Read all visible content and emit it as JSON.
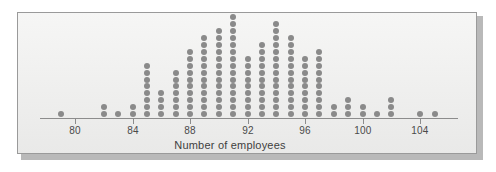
{
  "figure": {
    "panel_background": "#f2f2f1",
    "panel_border_color": "#9a9a9a",
    "dot_color": "#8a8a8a",
    "axis_color": "#8c8c8c"
  },
  "chart_data": {
    "type": "scatter",
    "plot_style": "dot-plot",
    "title": "",
    "subtitle": "",
    "xlabel": "Number of employees",
    "ylabel": "",
    "xlim": [
      78,
      106
    ],
    "ylim": [
      0,
      16
    ],
    "grid": false,
    "legend": null,
    "legend_position": "none",
    "xticks": [
      80,
      84,
      88,
      92,
      96,
      100,
      104
    ],
    "xtick_labels": [
      "80",
      "84",
      "88",
      "92",
      "96",
      "100",
      "104"
    ],
    "x": [
      79,
      82,
      83,
      84,
      85,
      86,
      87,
      88,
      89,
      90,
      91,
      92,
      93,
      94,
      95,
      96,
      97,
      98,
      99,
      100,
      101,
      102,
      104,
      105
    ],
    "counts": [
      1,
      2,
      1,
      2,
      8,
      4,
      7,
      10,
      12,
      13,
      15,
      9,
      11,
      14,
      12,
      9,
      10,
      2,
      3,
      2,
      1,
      3,
      1,
      1
    ],
    "total_observations": 153,
    "annotations": []
  },
  "axis": {
    "title": "Number of employees",
    "ticks": [
      {
        "value": 80,
        "label": "80"
      },
      {
        "value": 84,
        "label": "84"
      },
      {
        "value": 88,
        "label": "88"
      },
      {
        "value": 92,
        "label": "92"
      },
      {
        "value": 96,
        "label": "96"
      },
      {
        "value": 100,
        "label": "100"
      },
      {
        "value": 104,
        "label": "104"
      }
    ]
  }
}
